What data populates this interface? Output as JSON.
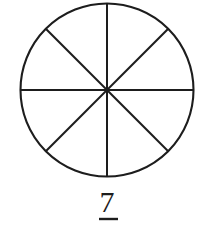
{
  "figure": {
    "kind": "fraction-pie-model",
    "background_color": "#ffffff",
    "stroke_color": "#1d1d1d",
    "caption_numeral": "7",
    "fraction_bar_visible": true,
    "fraction_bar_label": "fraction-bar"
  },
  "chart_data": {
    "type": "pie",
    "title": "",
    "subtitle": "",
    "xlabel": "",
    "ylabel": "",
    "legend": [],
    "grid": false,
    "equal_sectors": true,
    "sector_count": 8,
    "shaded_count": 0,
    "categories": [
      "sector-1",
      "sector-2",
      "sector-3",
      "sector-4",
      "sector-5",
      "sector-6",
      "sector-7",
      "sector-8"
    ],
    "values": [
      1,
      1,
      1,
      1,
      1,
      1,
      1,
      1
    ],
    "slice_angle_degrees": 45,
    "fill_color": "#ffffff",
    "stroke_color": "#1d1d1d",
    "stroke_width": 2.1,
    "center": {
      "x": 107,
      "y": 90
    },
    "radius": 86.5,
    "divider_angles_degrees": [
      0,
      45,
      90,
      135
    ],
    "annotations": [
      {
        "name": "numerator",
        "text": "7",
        "x": 107,
        "y": 212
      },
      {
        "name": "fraction-bar",
        "text": "",
        "x": 109,
        "y": 219
      }
    ]
  },
  "geometry": {
    "circle": {
      "cx": 107,
      "cy": 90,
      "r": 86.5,
      "stroke_width": 2.1
    },
    "dividers": [
      {
        "name": "vertical-diameter",
        "x1": 107,
        "y1": 3.5,
        "x2": 107,
        "y2": 176.5,
        "stroke_width": 2.0
      },
      {
        "name": "horizontal-diameter",
        "x1": 20.5,
        "y1": 90,
        "x2": 193.5,
        "y2": 90,
        "stroke_width": 2.0
      },
      {
        "name": "diagonal-diameter-nw-se",
        "x1": 45.8,
        "y1": 28.8,
        "x2": 168.2,
        "y2": 151.2,
        "stroke_width": 2.0
      },
      {
        "name": "diagonal-diameter-ne-sw",
        "x1": 168.2,
        "y1": 28.8,
        "x2": 45.8,
        "y2": 151.2,
        "stroke_width": 2.0
      }
    ],
    "fraction_bar": {
      "x1": 99,
      "y1": 219,
      "x2": 118,
      "y2": 219,
      "stroke_width": 2.4
    },
    "numeral": {
      "x": 107,
      "y": 212,
      "font_size": 30
    }
  }
}
